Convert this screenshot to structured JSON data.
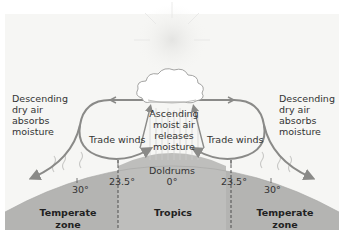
{
  "diagram": {
    "labels": {
      "left_descending": [
        "Descending",
        "dry air",
        "absorbs",
        "moisture"
      ],
      "right_descending": [
        "Descending",
        "dry air",
        "absorbs",
        "moisture"
      ],
      "ascending": [
        "Ascending",
        "moist air",
        "releases",
        "moisture"
      ],
      "trade_winds_left": "Trade winds",
      "trade_winds_right": "Trade winds",
      "doldrums": "Doldrums",
      "doldrums_degree": "0°"
    },
    "latitudes": {
      "left_30": "30°",
      "left_23_5": "23.5°",
      "right_23_5": "23.5°",
      "right_30": "30°"
    },
    "zones": {
      "left": [
        "Temperate",
        "zone"
      ],
      "center": "Tropics",
      "right": [
        "Temperate",
        "zone"
      ]
    },
    "colors": {
      "background": "#f6f6f4",
      "earth": "#b4b4b2",
      "tropics_band": "#bdbdbb",
      "arrow": "#8a8a88",
      "sun_glow": "#e4e4e2",
      "cloud": "#ffffff",
      "text": "#333333"
    },
    "icons": [
      "sun-icon",
      "cloud-icon",
      "wind-arrow-icon",
      "heat-wave-icon",
      "rising-air-icon"
    ]
  }
}
